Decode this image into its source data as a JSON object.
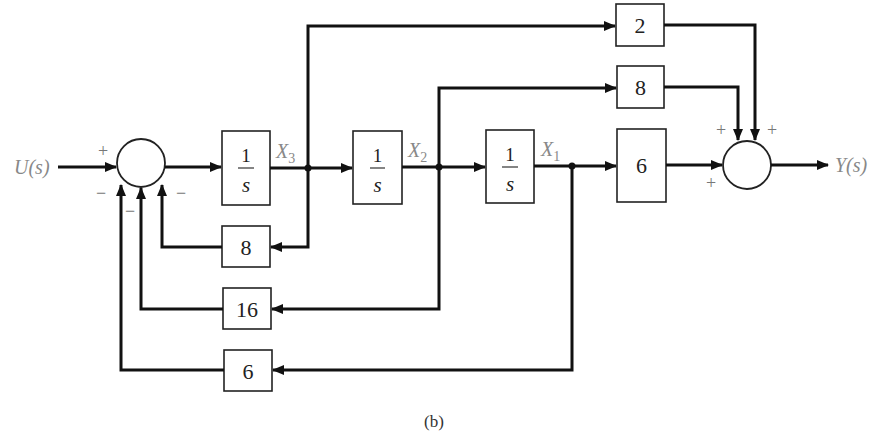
{
  "diagram": {
    "type": "block-diagram",
    "caption": "(b)",
    "input": {
      "label": "U(s)",
      "color": "#888888"
    },
    "output": {
      "label": "Y(s)",
      "color": "#888888"
    },
    "states": [
      {
        "base": "X",
        "sub": "3"
      },
      {
        "base": "X",
        "sub": "2"
      },
      {
        "base": "X",
        "sub": "1"
      }
    ],
    "integrators": [
      {
        "num": "1",
        "den": "s"
      },
      {
        "num": "1",
        "den": "s"
      },
      {
        "num": "1",
        "den": "s"
      }
    ],
    "feedforward_gains": [
      {
        "from": "X3",
        "value": "2"
      },
      {
        "from": "X2",
        "value": "8"
      },
      {
        "from": "X1",
        "value": "6"
      }
    ],
    "feedback_gains": [
      {
        "from": "X3",
        "value": "8"
      },
      {
        "from": "X2",
        "value": "16"
      },
      {
        "from": "X1",
        "value": "6"
      }
    ],
    "input_summer_signs": {
      "input": "+",
      "fb_x1": "−",
      "fb_x2": "−",
      "fb_x3": "−"
    },
    "output_summer_signs": {
      "ff_x2": "+",
      "ff_x3": "+",
      "ff_x1": "+"
    }
  }
}
